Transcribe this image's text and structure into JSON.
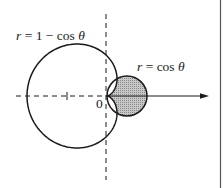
{
  "figure": {
    "labels": {
      "cardioid": "r = 1 − cos θ",
      "circle": "r = cos θ",
      "origin": "0"
    },
    "curves": [
      {
        "name": "cardioid",
        "equation": "r = 1 - cos(theta)",
        "fill": "none"
      },
      {
        "name": "circle",
        "equation": "r = cos(theta)",
        "fill": "shaded"
      }
    ],
    "shaded_region": "inside r = cos θ and outside r = 1 − cos θ",
    "axes": {
      "polar_axis": "arrow pointing right",
      "vertical_line": "dashed",
      "negative_x": "dashed",
      "tick_marks": [
        "-1"
      ]
    },
    "colors": {
      "stroke": "#1a1a1a",
      "shade": "#b0b0b0",
      "border": "#555555"
    }
  }
}
